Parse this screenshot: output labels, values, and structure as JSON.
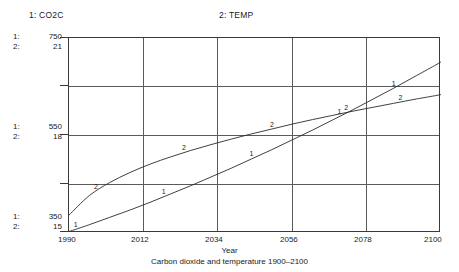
{
  "legend": {
    "series1": "1: CO2C",
    "series2": "2: TEMP"
  },
  "axis": {
    "y_groups": [
      {
        "key1": "1:",
        "val1": "750",
        "key2": "2:",
        "val2": "21"
      },
      {
        "key1": "1:",
        "val1": "550",
        "key2": "2:",
        "val2": "18"
      },
      {
        "key1": "1:",
        "val1": "350",
        "key2": "2:",
        "val2": "15"
      }
    ],
    "x_ticks": [
      "1990",
      "2012",
      "2034",
      "2056",
      "2078",
      "2100"
    ],
    "x_title": "Year"
  },
  "caption": "Carbon dioxide and temperature 1900–2100",
  "chart_data": {
    "type": "line",
    "title": "Carbon dioxide and temperature 1900–2100",
    "xlabel": "Year",
    "ylabel": "",
    "grid": true,
    "legend_position": "top",
    "xlim": [
      1990,
      2100
    ],
    "x_ticks": [
      1990,
      2012,
      2034,
      2056,
      2078,
      2100
    ],
    "axes": [
      {
        "id": 1,
        "name": "CO2C",
        "label": "1: CO2C",
        "ylim": [
          350,
          750
        ],
        "y_ticks": [
          350,
          550,
          750
        ],
        "units": "ppm"
      },
      {
        "id": 2,
        "name": "TEMP",
        "label": "2: TEMP",
        "ylim": [
          15,
          21
        ],
        "y_ticks": [
          15,
          18,
          21
        ],
        "units": "degC"
      }
    ],
    "series": [
      {
        "name": "CO2C",
        "marker": "1",
        "axis": 1,
        "x": [
          1990,
          1996,
          2002,
          2008,
          2014,
          2020,
          2026,
          2032,
          2038,
          2044,
          2050,
          2056,
          2062,
          2068,
          2074,
          2080,
          2086,
          2092,
          2098,
          2100
        ],
        "values": [
          353,
          367,
          382,
          397,
          413,
          430,
          447,
          465,
          483,
          502,
          521,
          541,
          561,
          582,
          603,
          625,
          647,
          670,
          693,
          701
        ]
      },
      {
        "name": "TEMP",
        "marker": "2",
        "axis": 2,
        "x": [
          1990,
          1996,
          2002,
          2008,
          2014,
          2020,
          2026,
          2032,
          2038,
          2044,
          2050,
          2056,
          2062,
          2068,
          2074,
          2080,
          2086,
          2092,
          2098,
          2100
        ],
        "values": [
          15.55,
          16.15,
          16.55,
          16.86,
          17.12,
          17.34,
          17.54,
          17.72,
          17.89,
          18.05,
          18.2,
          18.35,
          18.49,
          18.62,
          18.75,
          18.87,
          18.99,
          19.11,
          19.22,
          19.26
        ]
      }
    ],
    "series_markers": [
      {
        "series": "CO2C",
        "marker": "1",
        "x": [
          1992,
          2018,
          2044,
          2070,
          2086
        ]
      },
      {
        "series": "TEMP",
        "marker": "2",
        "x": [
          1998,
          2024,
          2050,
          2072,
          2088
        ]
      }
    ]
  }
}
